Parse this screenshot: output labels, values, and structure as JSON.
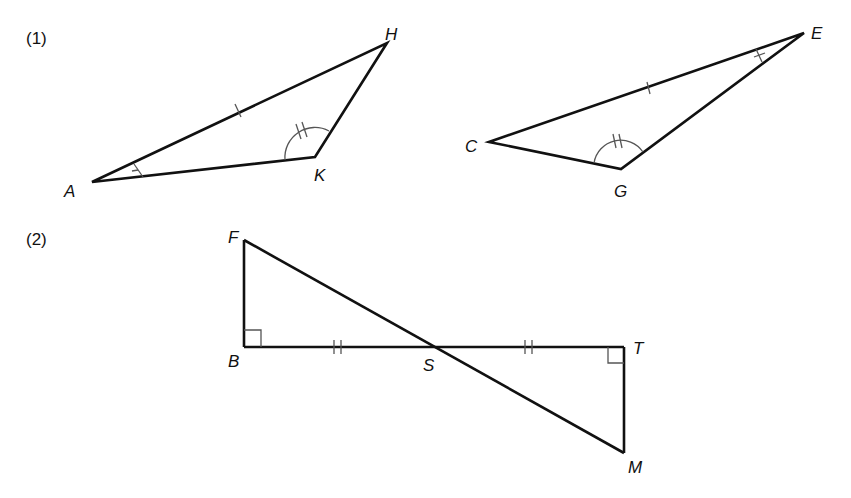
{
  "figure": {
    "part1": {
      "label": "(1)",
      "triangle1": {
        "vertices": {
          "A": "A",
          "K": "K",
          "H": "H"
        },
        "marks": {
          "side_AH": "single tick",
          "angle_A": "single tick",
          "angle_K": "double-tick arc"
        }
      },
      "triangle2": {
        "vertices": {
          "C": "C",
          "G": "G",
          "E": "E"
        },
        "marks": {
          "side_CE": "single tick",
          "angle_E": "single tick",
          "angle_G": "double-tick arc"
        }
      }
    },
    "part2": {
      "label": "(2)",
      "vertices": {
        "F": "F",
        "B": "B",
        "S": "S",
        "T": "T",
        "M": "M"
      },
      "marks": {
        "side_BS": "double tick",
        "side_ST": "double tick",
        "angle_B": "right angle",
        "angle_T": "right angle"
      }
    }
  }
}
